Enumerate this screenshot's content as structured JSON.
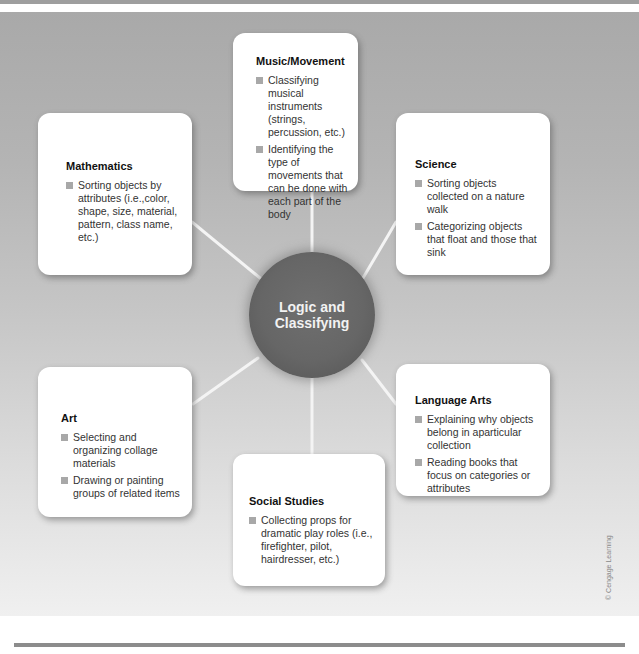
{
  "diagram": {
    "center": {
      "label_line1": "Logic and",
      "label_line2": "Classifying"
    },
    "domains": [
      {
        "title": "Music/Movement",
        "items": [
          "Classifying musical instruments (strings, percussion, etc.)",
          "Identifying the type of movements that can be done with each part of the body"
        ]
      },
      {
        "title": "Mathematics",
        "items": [
          "Sorting objects by attributes (i.e.,color, shape, size, material, pattern, class name, etc.)"
        ]
      },
      {
        "title": "Science",
        "items": [
          "Sorting objects collected on a nature walk",
          "Categorizing objects that float and those that sink"
        ]
      },
      {
        "title": "Art",
        "items": [
          "Selecting and organizing collage materials",
          "Drawing or painting groups of related items"
        ]
      },
      {
        "title": "Language Arts",
        "items": [
          "Explaining why objects belong in aparticular collection",
          "Reading books that focus on categories or attributes"
        ]
      },
      {
        "title": "Social Studies",
        "items": [
          "Collecting props for dramatic play roles (i.e., firefighter, pilot, hairdresser, etc.)"
        ]
      }
    ],
    "credit": "© Cengage Learning"
  },
  "colors": {
    "hub": "#666666",
    "hub_text": "#f2f2f2",
    "card": "#ffffff",
    "bullet": "#a8a8a8",
    "spoke": "#f4f4f4",
    "background_top": "#a9a9a9",
    "background_bottom": "#f0f0f0"
  }
}
